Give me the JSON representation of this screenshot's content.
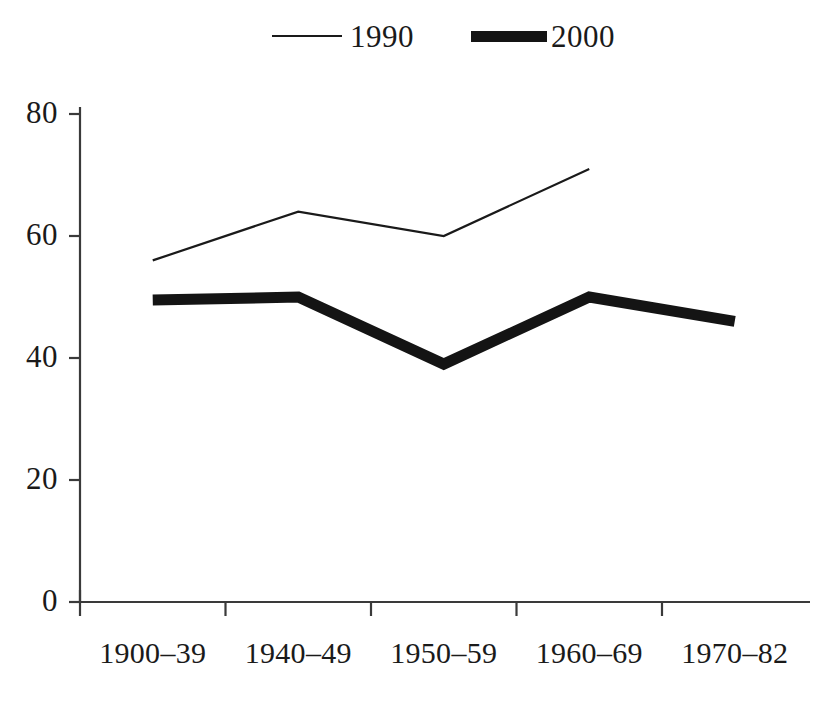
{
  "chart_data": {
    "type": "line",
    "title": "",
    "subtitle": "",
    "xlabel": "",
    "ylabel": "",
    "categories": [
      "1900–39",
      "1940–49",
      "1950–59",
      "1960–69",
      "1970–82"
    ],
    "series": [
      {
        "name": "1990",
        "style": "thin-line",
        "color": "#1a1a1a",
        "values": [
          56,
          64,
          60,
          71,
          null
        ]
      },
      {
        "name": "2000",
        "style": "thick-line",
        "color": "#141414",
        "values": [
          49.5,
          50,
          39,
          50,
          46
        ]
      }
    ],
    "ylim": [
      0,
      80
    ],
    "yticks": [
      0,
      20,
      40,
      60,
      80
    ],
    "ytick_labels": [
      "0",
      "20",
      "40",
      "60",
      "80"
    ],
    "xtick_labels": [
      "1900–39",
      "1940–49",
      "1950–59",
      "1960–69",
      "1970–82"
    ],
    "grid": false,
    "legend": {
      "position": "top",
      "entries": [
        {
          "label": "1990",
          "style": "thin-line"
        },
        {
          "label": "2000",
          "style": "thick-line"
        }
      ]
    },
    "axis_color": "#3a3a3a"
  }
}
